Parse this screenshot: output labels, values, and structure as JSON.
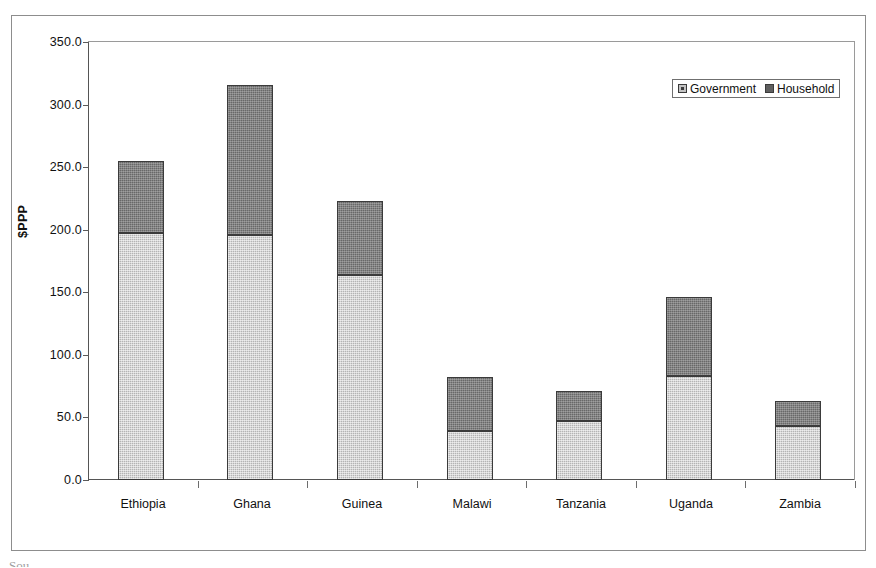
{
  "chart_data": {
    "type": "bar",
    "subtype": "stacked-vertical",
    "title": "",
    "xlabel": "",
    "ylabel": "$PPP",
    "ylim": [
      0.0,
      350.0
    ],
    "ytick_step": 50.0,
    "ytick_labels": [
      "350.0",
      "300.0",
      "250.0",
      "200.0",
      "150.0",
      "100.0",
      "50.0",
      "0.0"
    ],
    "ytick_values": [
      350.0,
      300.0,
      250.0,
      200.0,
      150.0,
      100.0,
      50.0,
      0.0
    ],
    "grid": false,
    "legend_position": "top-right",
    "categories": [
      "Ethiopia",
      "Ghana",
      "Guinea",
      "Malawi",
      "Tanzania",
      "Uganda",
      "Zambia"
    ],
    "series": [
      {
        "name": "Government",
        "color": "#b4b4b4",
        "values": [
          197,
          196,
          164,
          39,
          47,
          83,
          43
        ]
      },
      {
        "name": "Household",
        "color": "#686868",
        "values": [
          58,
          120,
          59,
          43,
          24,
          63,
          20
        ]
      }
    ],
    "totals": [
      255,
      316,
      223,
      82,
      71,
      146,
      63
    ]
  },
  "legend": {
    "entries": [
      {
        "label": "Government",
        "swatch": "government-swatch"
      },
      {
        "label": "Household",
        "swatch": "household-swatch"
      }
    ]
  },
  "artifact": {
    "text": "Sou"
  }
}
